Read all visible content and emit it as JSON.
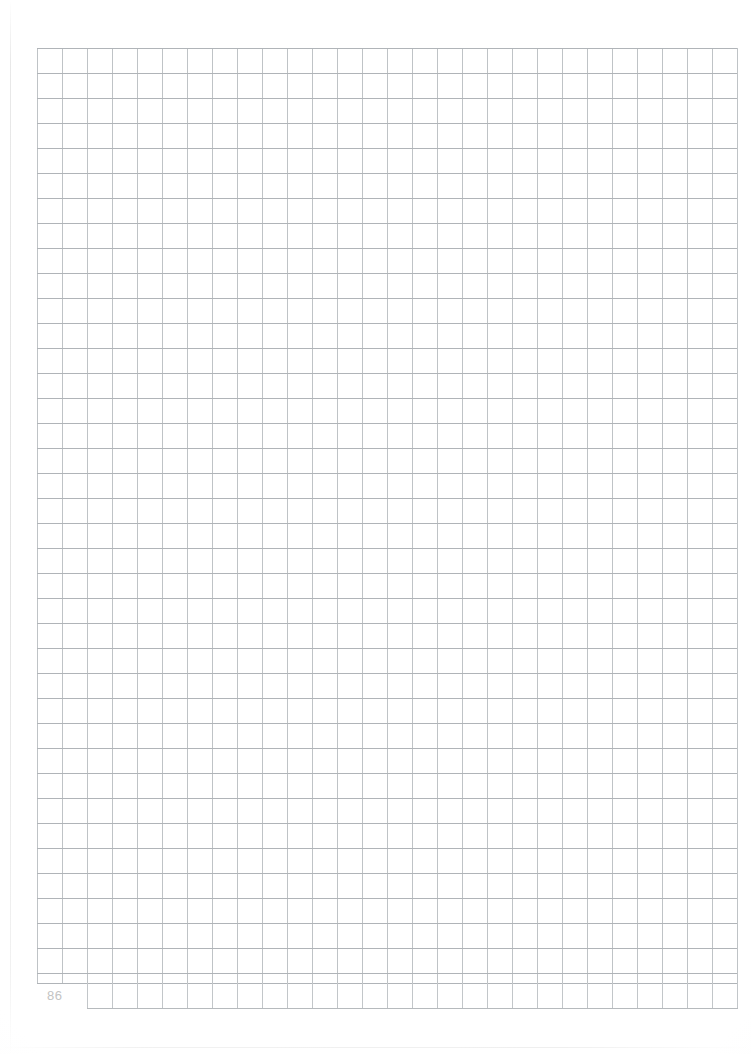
{
  "page": {
    "kind": "graph-paper-scan",
    "page_number": "86",
    "background_color": "#ffffff",
    "width_px": 751,
    "height_px": 1054
  },
  "grid": {
    "cell_size_px": 25,
    "columns": 28,
    "rows": 37,
    "line_color_horizontal": "#b0b4b8",
    "line_color_vertical": "#bfc3c6",
    "origin_x_px": 37,
    "origin_y_px": 48,
    "width_px": 700,
    "height_px": 935
  },
  "footer_row": {
    "origin_x_px": 87,
    "origin_y_px": 983,
    "width_px": 650,
    "height_px": 25,
    "columns": 26,
    "line_color": "#c2c6c9"
  },
  "page_number_style": {
    "color": "#c3c3c3",
    "font_size_px": 13
  },
  "artifacts": {
    "left_seam_color": "#d6d6d6",
    "bottom_seam_color": "#e4e4e4"
  }
}
